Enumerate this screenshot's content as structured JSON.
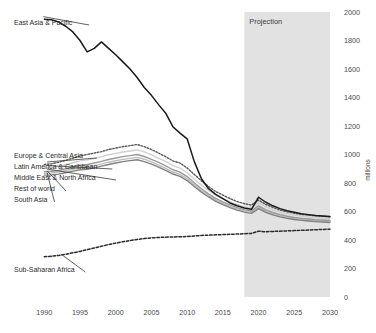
{
  "chart_data": {
    "type": "line",
    "title": "",
    "subtitle": "",
    "xlabel": "",
    "ylabel": "millions",
    "xlim": [
      1988,
      2030
    ],
    "ylim": [
      0,
      2000
    ],
    "grid": false,
    "legend_position": "inline-left-labels",
    "x_ticks": [
      "1990",
      "1995",
      "2000",
      "2005",
      "2010",
      "2015",
      "2020",
      "2025",
      "2030"
    ],
    "x_tick_values": [
      1990,
      1995,
      2000,
      2005,
      2010,
      2015,
      2020,
      2025,
      2030
    ],
    "y_ticks": [
      "0",
      "200",
      "400",
      "600",
      "800",
      "1000",
      "1200",
      "1400",
      "1600",
      "1800",
      "2000"
    ],
    "y_tick_values": [
      0,
      200,
      400,
      600,
      800,
      1000,
      1200,
      1400,
      1600,
      1800,
      2000
    ],
    "annotations": [
      {
        "name": "projection-band",
        "label": "Projection",
        "x_start": 2018,
        "x_end": 2030,
        "color": "#e2e2e2"
      }
    ],
    "x": [
      1990,
      1991,
      1992,
      1993,
      1994,
      1995,
      1996,
      1997,
      1998,
      1999,
      2000,
      2001,
      2002,
      2003,
      2004,
      2005,
      2006,
      2007,
      2008,
      2009,
      2010,
      2011,
      2012,
      2013,
      2014,
      2015,
      2016,
      2017,
      2018,
      2019,
      2020,
      2021,
      2022,
      2023,
      2024,
      2025,
      2026,
      2027,
      2028,
      2029,
      2030
    ],
    "series": [
      {
        "name": "East Asia & Pacific",
        "label": "East Asia & Pacific",
        "color": "#1a1a1a",
        "style": "solid",
        "width": 1.5,
        "label_x": 14,
        "label_y": 25,
        "values": [
          1950,
          1945,
          1930,
          1900,
          1860,
          1800,
          1720,
          1745,
          1790,
          1745,
          1700,
          1650,
          1600,
          1540,
          1470,
          1415,
          1350,
          1290,
          1195,
          1150,
          1110,
          950,
          830,
          760,
          720,
          690,
          660,
          640,
          625,
          615,
          700,
          665,
          640,
          620,
          605,
          595,
          585,
          578,
          572,
          568,
          565
        ]
      },
      {
        "name": "Europe & Central Asia",
        "label": "Europe & Central Asia",
        "color": "#5a5a5a",
        "style": "dotted",
        "width": 1.4,
        "label_x": 14,
        "label_y": 158,
        "values": [
          930,
          935,
          945,
          960,
          975,
          990,
          1000,
          1010,
          1020,
          1035,
          1045,
          1055,
          1062,
          1070,
          1055,
          1035,
          1010,
          985,
          955,
          940,
          905,
          860,
          815,
          775,
          740,
          715,
          690,
          670,
          655,
          645,
          680,
          650,
          628,
          610,
          598,
          588,
          580,
          574,
          570,
          566,
          562
        ]
      },
      {
        "name": "Latin America & Caribbean",
        "label": "Latin America & Caribbean",
        "color": "#d0d0d0",
        "style": "solid",
        "width": 1.4,
        "label_x": 14,
        "label_y": 169,
        "values": [
          905,
          908,
          915,
          928,
          942,
          955,
          962,
          972,
          985,
          998,
          1008,
          1018,
          1025,
          1032,
          1018,
          998,
          975,
          950,
          922,
          905,
          872,
          828,
          785,
          748,
          715,
          690,
          668,
          648,
          634,
          624,
          662,
          632,
          612,
          596,
          584,
          575,
          568,
          562,
          558,
          554,
          551
        ]
      },
      {
        "name": "Middle East & North Africa",
        "label": "Middle East & North Africa",
        "color": "#9a9a9a",
        "style": "solid",
        "width": 1.4,
        "label_x": 14,
        "label_y": 180,
        "values": [
          880,
          882,
          888,
          900,
          912,
          925,
          930,
          940,
          952,
          965,
          975,
          985,
          992,
          1000,
          986,
          966,
          944,
          920,
          893,
          876,
          845,
          802,
          760,
          724,
          692,
          668,
          646,
          627,
          613,
          604,
          640,
          612,
          593,
          578,
          567,
          558,
          552,
          547,
          543,
          540,
          537
        ]
      },
      {
        "name": "Rest of world",
        "label": "Rest of world",
        "color": "#bdbdbd",
        "style": "solid",
        "width": 1.4,
        "label_x": 14,
        "label_y": 191,
        "values": [
          868,
          870,
          876,
          886,
          898,
          908,
          912,
          922,
          934,
          946,
          956,
          966,
          973,
          980,
          967,
          948,
          926,
          903,
          877,
          860,
          830,
          788,
          747,
          712,
          681,
          657,
          636,
          618,
          604,
          595,
          630,
          603,
          584,
          570,
          559,
          551,
          545,
          540,
          536,
          533,
          530
        ]
      },
      {
        "name": "South Asia",
        "label": "South Asia",
        "color": "#808080",
        "style": "solid",
        "width": 1.4,
        "label_x": 14,
        "label_y": 202,
        "values": [
          855,
          857,
          862,
          872,
          883,
          893,
          896,
          906,
          918,
          930,
          940,
          950,
          957,
          963,
          950,
          932,
          911,
          888,
          863,
          846,
          817,
          776,
          736,
          702,
          671,
          648,
          627,
          610,
          596,
          587,
          620,
          594,
          576,
          562,
          552,
          544,
          538,
          533,
          529,
          526,
          523
        ]
      },
      {
        "name": "Sub-Saharan Africa",
        "label": "Sub-Saharan Africa",
        "color": "#2b2b2b",
        "style": "dashed",
        "width": 1.5,
        "label_x": 14,
        "label_y": 272,
        "values": [
          282,
          286,
          292,
          300,
          310,
          320,
          332,
          344,
          356,
          368,
          378,
          388,
          396,
          404,
          410,
          415,
          418,
          420,
          421,
          423,
          424,
          428,
          432,
          434,
          436,
          438,
          440,
          442,
          444,
          446,
          462,
          458,
          460,
          462,
          464,
          466,
          468,
          470,
          472,
          474,
          476
        ]
      }
    ]
  }
}
